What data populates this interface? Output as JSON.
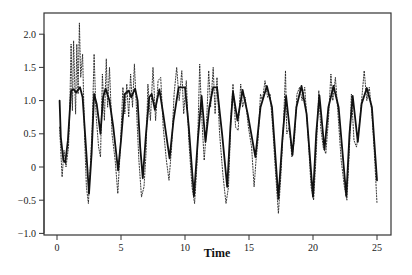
{
  "chart_data": {
    "type": "line",
    "title": "",
    "xlabel": "Time",
    "ylabel": "",
    "xlim": [
      -1.0,
      26.3
    ],
    "ylim": [
      -1.05,
      2.35
    ],
    "grid": false,
    "legend": null,
    "x_ticks": [
      0,
      5,
      10,
      15,
      20,
      25
    ],
    "x_tick_labels": [
      "0",
      "5",
      "10",
      "15",
      "20",
      "25"
    ],
    "y_ticks": [
      -1.0,
      -0.5,
      0,
      0.5,
      1.0,
      1.5,
      2.0
    ],
    "y_tick_labels": [
      "−1.0",
      "−0.5",
      "0",
      "0.5",
      "1.0",
      "1.5",
      "2.0"
    ],
    "series": [
      {
        "name": "smooth",
        "style": "solid",
        "color": "#111111",
        "width": 1.8,
        "points": [
          [
            0.2,
            1.0
          ],
          [
            0.3,
            0.45
          ],
          [
            0.5,
            0.1
          ],
          [
            0.65,
            0.07
          ],
          [
            0.85,
            0.4
          ],
          [
            1.1,
            1.15
          ],
          [
            1.3,
            1.17
          ],
          [
            1.5,
            1.12
          ],
          [
            1.8,
            1.2
          ],
          [
            2.0,
            1.05
          ],
          [
            2.3,
            0.2
          ],
          [
            2.5,
            -0.4
          ],
          [
            2.7,
            0.2
          ],
          [
            2.9,
            1.1
          ],
          [
            3.1,
            0.95
          ],
          [
            3.4,
            0.5
          ],
          [
            3.6,
            1.05
          ],
          [
            3.8,
            1.18
          ],
          [
            4.1,
            1.0
          ],
          [
            4.4,
            0.6
          ],
          [
            4.77,
            -0.05
          ],
          [
            5.0,
            0.4
          ],
          [
            5.3,
            1.1
          ],
          [
            5.6,
            1.15
          ],
          [
            5.8,
            1.05
          ],
          [
            6.1,
            1.18
          ],
          [
            6.3,
            1.0
          ],
          [
            6.5,
            0.3
          ],
          [
            6.7,
            -0.17
          ],
          [
            6.95,
            0.5
          ],
          [
            7.2,
            1.05
          ],
          [
            7.4,
            1.1
          ],
          [
            7.65,
            0.86
          ],
          [
            8.0,
            1.17
          ],
          [
            8.3,
            0.8
          ],
          [
            8.8,
            0.13
          ],
          [
            9.1,
            0.7
          ],
          [
            9.5,
            1.2
          ],
          [
            10.0,
            1.2
          ],
          [
            10.3,
            0.6
          ],
          [
            10.7,
            -0.44
          ],
          [
            11.0,
            0.4
          ],
          [
            11.3,
            1.07
          ],
          [
            11.6,
            0.38
          ],
          [
            11.9,
            0.9
          ],
          [
            12.2,
            1.2
          ],
          [
            12.5,
            1.2
          ],
          [
            12.9,
            0.5
          ],
          [
            13.3,
            -0.3
          ],
          [
            13.55,
            0.6
          ],
          [
            13.75,
            1.13
          ],
          [
            14.1,
            0.7
          ],
          [
            14.5,
            1.16
          ],
          [
            14.9,
            0.8
          ],
          [
            15.5,
            0.15
          ],
          [
            15.9,
            0.9
          ],
          [
            16.4,
            1.22
          ],
          [
            16.8,
            0.9
          ],
          [
            17.3,
            -0.48
          ],
          [
            17.6,
            0.4
          ],
          [
            17.9,
            1.07
          ],
          [
            18.4,
            0.18
          ],
          [
            18.7,
            0.9
          ],
          [
            19.1,
            1.22
          ],
          [
            19.5,
            0.8
          ],
          [
            20.0,
            -0.45
          ],
          [
            20.25,
            0.5
          ],
          [
            20.5,
            1.08
          ],
          [
            20.9,
            0.26
          ],
          [
            21.2,
            0.9
          ],
          [
            21.6,
            1.22
          ],
          [
            22.0,
            0.9
          ],
          [
            22.6,
            -0.44
          ],
          [
            22.85,
            0.5
          ],
          [
            23.1,
            1.07
          ],
          [
            23.5,
            0.38
          ],
          [
            23.8,
            0.95
          ],
          [
            24.2,
            1.19
          ],
          [
            24.6,
            0.9
          ],
          [
            25.0,
            -0.2
          ]
        ]
      },
      {
        "name": "observed",
        "style": "dotted",
        "color": "#222222",
        "width": 0.9,
        "points": [
          [
            0.2,
            0.6
          ],
          [
            0.4,
            -0.15
          ],
          [
            0.55,
            0.25
          ],
          [
            0.7,
            0.0
          ],
          [
            0.9,
            0.3
          ],
          [
            1.0,
            0.9
          ],
          [
            1.1,
            1.85
          ],
          [
            1.2,
            0.85
          ],
          [
            1.3,
            1.9
          ],
          [
            1.45,
            0.8
          ],
          [
            1.55,
            1.85
          ],
          [
            1.65,
            1.1
          ],
          [
            1.75,
            2.17
          ],
          [
            1.85,
            1.35
          ],
          [
            2.0,
            1.7
          ],
          [
            2.15,
            0.5
          ],
          [
            2.3,
            -0.3
          ],
          [
            2.45,
            -0.55
          ],
          [
            2.6,
            0.0
          ],
          [
            2.75,
            0.6
          ],
          [
            2.9,
            1.7
          ],
          [
            3.05,
            0.8
          ],
          [
            3.25,
            0.3
          ],
          [
            3.4,
            0.15
          ],
          [
            3.55,
            1.4
          ],
          [
            3.7,
            0.7
          ],
          [
            3.85,
            1.63
          ],
          [
            3.95,
            0.9
          ],
          [
            4.1,
            1.5
          ],
          [
            4.3,
            0.5
          ],
          [
            4.55,
            0.1
          ],
          [
            4.75,
            -0.4
          ],
          [
            4.95,
            0.3
          ],
          [
            5.15,
            1.2
          ],
          [
            5.3,
            0.8
          ],
          [
            5.45,
            1.25
          ],
          [
            5.6,
            0.75
          ],
          [
            5.75,
            1.4
          ],
          [
            5.9,
            0.9
          ],
          [
            6.05,
            1.55
          ],
          [
            6.2,
            0.9
          ],
          [
            6.4,
            0.1
          ],
          [
            6.6,
            -0.45
          ],
          [
            6.8,
            -0.3
          ],
          [
            6.95,
            0.2
          ],
          [
            7.1,
            1.25
          ],
          [
            7.3,
            0.7
          ],
          [
            7.5,
            1.5
          ],
          [
            7.7,
            0.7
          ],
          [
            7.9,
            1.3
          ],
          [
            8.1,
            1.35
          ],
          [
            8.3,
            0.6
          ],
          [
            8.55,
            0.1
          ],
          [
            8.75,
            -0.2
          ],
          [
            8.95,
            0.3
          ],
          [
            9.15,
            1.1
          ],
          [
            9.35,
            1.5
          ],
          [
            9.55,
            1.0
          ],
          [
            9.75,
            1.45
          ],
          [
            9.9,
            0.8
          ],
          [
            10.1,
            1.3
          ],
          [
            10.3,
            0.4
          ],
          [
            10.55,
            -0.3
          ],
          [
            10.75,
            -0.55
          ],
          [
            10.95,
            0.1
          ],
          [
            11.15,
            1.55
          ],
          [
            11.3,
            0.8
          ],
          [
            11.5,
            0.1
          ],
          [
            11.65,
            0.5
          ],
          [
            11.85,
            1.45
          ],
          [
            12.0,
            0.9
          ],
          [
            12.2,
            1.5
          ],
          [
            12.35,
            0.8
          ],
          [
            12.5,
            1.35
          ],
          [
            12.7,
            0.5
          ],
          [
            12.95,
            -0.1
          ],
          [
            13.2,
            -0.55
          ],
          [
            13.4,
            -0.3
          ],
          [
            13.6,
            0.8
          ],
          [
            13.75,
            1.25
          ],
          [
            13.95,
            0.6
          ],
          [
            14.15,
            0.55
          ],
          [
            14.35,
            1.25
          ],
          [
            14.5,
            0.9
          ],
          [
            14.7,
            1.05
          ],
          [
            14.95,
            0.6
          ],
          [
            15.2,
            0.3
          ],
          [
            15.4,
            -0.3
          ],
          [
            15.55,
            0.1
          ],
          [
            15.7,
            0.4
          ],
          [
            15.9,
            1.1
          ],
          [
            16.05,
            1.0
          ],
          [
            16.25,
            1.3
          ],
          [
            16.45,
            1.05
          ],
          [
            16.65,
            1.1
          ],
          [
            16.85,
            0.6
          ],
          [
            17.05,
            0.0
          ],
          [
            17.3,
            -0.7
          ],
          [
            17.5,
            -0.1
          ],
          [
            17.7,
            0.7
          ],
          [
            17.85,
            1.45
          ],
          [
            17.95,
            0.5
          ],
          [
            18.15,
            0.6
          ],
          [
            18.35,
            0.15
          ],
          [
            18.55,
            0.4
          ],
          [
            18.75,
            1.1
          ],
          [
            18.95,
            1.2
          ],
          [
            19.15,
            1.0
          ],
          [
            19.35,
            1.2
          ],
          [
            19.6,
            0.5
          ],
          [
            19.85,
            -0.3
          ],
          [
            20.05,
            -0.5
          ],
          [
            20.25,
            0.2
          ],
          [
            20.45,
            1.15
          ],
          [
            20.6,
            0.6
          ],
          [
            20.8,
            0.3
          ],
          [
            21.0,
            0.2
          ],
          [
            21.2,
            0.7
          ],
          [
            21.4,
            1.4
          ],
          [
            21.55,
            1.0
          ],
          [
            21.75,
            1.35
          ],
          [
            21.95,
            0.8
          ],
          [
            22.2,
            0.1
          ],
          [
            22.45,
            -0.3
          ],
          [
            22.65,
            -0.5
          ],
          [
            22.85,
            0.3
          ],
          [
            23.0,
            1.1
          ],
          [
            23.2,
            0.4
          ],
          [
            23.4,
            0.3
          ],
          [
            23.6,
            0.6
          ],
          [
            23.8,
            1.0
          ],
          [
            24.0,
            1.45
          ],
          [
            24.2,
            1.0
          ],
          [
            24.4,
            1.2
          ],
          [
            24.6,
            0.8
          ],
          [
            24.8,
            0.2
          ],
          [
            25.0,
            -0.55
          ]
        ]
      }
    ]
  }
}
